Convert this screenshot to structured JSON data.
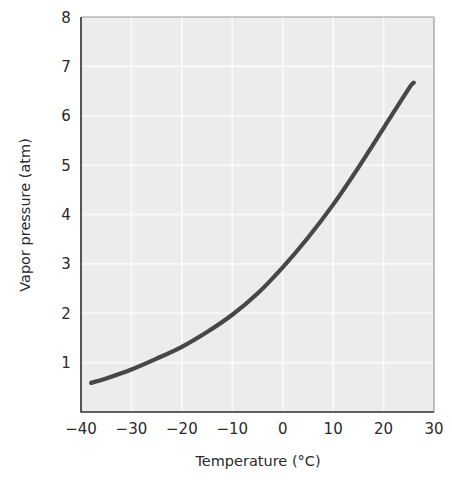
{
  "chart_data": {
    "type": "line",
    "title": "",
    "xlabel": "Temperature (°C)",
    "ylabel": "Vapor pressure (atm)",
    "xlim": [
      -40,
      30
    ],
    "ylim": [
      0,
      8
    ],
    "xticks": [
      -40,
      -30,
      -20,
      -10,
      0,
      10,
      20,
      30
    ],
    "xtick_labels": [
      "−40",
      "−30",
      "−20",
      "−10",
      "0",
      "10",
      "20",
      "30"
    ],
    "yticks": [
      1,
      2,
      3,
      4,
      5,
      6,
      7,
      8
    ],
    "ytick_labels": [
      "1",
      "2",
      "3",
      "4",
      "5",
      "6",
      "7",
      "8"
    ],
    "grid": true,
    "legend": null,
    "series": [
      {
        "name": "Vapor pressure curve",
        "x": [
          -38,
          -35,
          -30,
          -25,
          -20,
          -15,
          -10,
          -5,
          0,
          5,
          10,
          15,
          20,
          25,
          26
        ],
        "y": [
          0.59,
          0.68,
          0.86,
          1.08,
          1.32,
          1.62,
          1.97,
          2.4,
          2.93,
          3.53,
          4.2,
          4.95,
          5.75,
          6.55,
          6.67
        ]
      }
    ]
  },
  "colors": {
    "plot_background": "#ececec",
    "gridline": "#fafafa",
    "curve": "#474747",
    "axis_dark": "#2e2e2e",
    "axis_light": "#9a9a9a"
  }
}
